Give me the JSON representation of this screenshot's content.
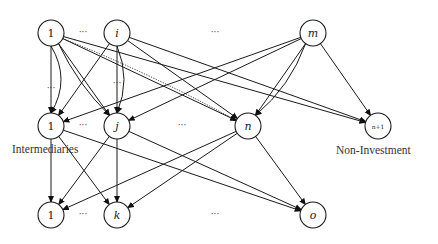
{
  "diagram": {
    "type": "layered-network",
    "rows": [
      {
        "name": "investors",
        "nodes": [
          {
            "id": "t1",
            "label": "1",
            "x": 51,
            "y": 33,
            "italic": false
          },
          {
            "id": "ti",
            "label": "i",
            "x": 117,
            "y": 33,
            "italic": true
          },
          {
            "id": "tm",
            "label": "m",
            "x": 313,
            "y": 33,
            "italic": true
          }
        ],
        "ellipses": [
          {
            "x": 83,
            "y": 33,
            "text": "···"
          },
          {
            "x": 215,
            "y": 33,
            "text": "···"
          }
        ]
      },
      {
        "name": "intermediaries",
        "nodes": [
          {
            "id": "m1",
            "label": "1",
            "x": 51,
            "y": 126,
            "italic": false
          },
          {
            "id": "mj",
            "label": "j",
            "x": 117,
            "y": 126,
            "italic": true
          },
          {
            "id": "mn",
            "label": "n",
            "x": 248,
            "y": 126,
            "italic": true
          },
          {
            "id": "mn1",
            "label": "n+1",
            "x": 378,
            "y": 126,
            "italic": false,
            "small": true
          }
        ],
        "ellipses": [
          {
            "x": 83,
            "y": 126,
            "text": "···"
          },
          {
            "x": 182,
            "y": 126,
            "text": "···"
          }
        ]
      },
      {
        "name": "outputs",
        "nodes": [
          {
            "id": "b1",
            "label": "1",
            "x": 51,
            "y": 215,
            "italic": false
          },
          {
            "id": "bk",
            "label": "k",
            "x": 117,
            "y": 215,
            "italic": true
          },
          {
            "id": "bo",
            "label": "o",
            "x": 313,
            "y": 215,
            "italic": true
          }
        ],
        "ellipses": [
          {
            "x": 83,
            "y": 215,
            "text": "···"
          },
          {
            "x": 215,
            "y": 215,
            "text": "···"
          }
        ]
      }
    ],
    "mid_ellipses": [
      {
        "x": 51,
        "y": 91,
        "text": "···"
      },
      {
        "x": 117,
        "y": 86,
        "text": "···"
      }
    ],
    "labels": {
      "intermediaries": "Intermediaries",
      "non_investment": "Non-Investment"
    },
    "edges": [
      {
        "from": "t1",
        "to": "m1",
        "style": "solid"
      },
      {
        "from": "t1",
        "to": "m1",
        "style": "solid",
        "curve": -20
      },
      {
        "from": "t1",
        "to": "mj",
        "style": "solid"
      },
      {
        "from": "t1",
        "to": "mj",
        "style": "solid",
        "curve": 8
      },
      {
        "from": "t1",
        "to": "mn",
        "style": "solid"
      },
      {
        "from": "t1",
        "to": "mn",
        "style": "dotted",
        "curve": -6
      },
      {
        "from": "t1",
        "to": "mn1",
        "style": "solid"
      },
      {
        "from": "ti",
        "to": "m1",
        "style": "solid"
      },
      {
        "from": "ti",
        "to": "mj",
        "style": "solid"
      },
      {
        "from": "ti",
        "to": "mj",
        "style": "solid",
        "curve": -14
      },
      {
        "from": "ti",
        "to": "mn",
        "style": "solid"
      },
      {
        "from": "ti",
        "to": "mn1",
        "style": "solid"
      },
      {
        "from": "tm",
        "to": "m1",
        "style": "solid"
      },
      {
        "from": "tm",
        "to": "mj",
        "style": "solid"
      },
      {
        "from": "tm",
        "to": "mn",
        "style": "solid"
      },
      {
        "from": "tm",
        "to": "mn",
        "style": "solid",
        "curve": -12
      },
      {
        "from": "tm",
        "to": "mn1",
        "style": "solid"
      },
      {
        "from": "m1",
        "to": "b1",
        "style": "solid"
      },
      {
        "from": "m1",
        "to": "bk",
        "style": "solid"
      },
      {
        "from": "m1",
        "to": "bo",
        "style": "solid"
      },
      {
        "from": "mj",
        "to": "b1",
        "style": "solid"
      },
      {
        "from": "mj",
        "to": "bk",
        "style": "solid"
      },
      {
        "from": "mj",
        "to": "bo",
        "style": "solid"
      },
      {
        "from": "mn",
        "to": "b1",
        "style": "solid"
      },
      {
        "from": "mn",
        "to": "bk",
        "style": "solid"
      },
      {
        "from": "mn",
        "to": "bo",
        "style": "solid"
      }
    ]
  }
}
